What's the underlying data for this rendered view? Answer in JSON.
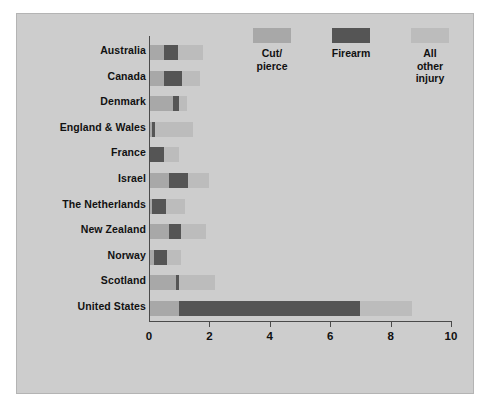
{
  "chart_data": {
    "type": "bar",
    "orientation": "horizontal",
    "stacked": true,
    "title": "",
    "subtitle": "",
    "xlabel": "",
    "ylabel": "",
    "xlim": [
      0,
      10
    ],
    "xticks": [
      0,
      2,
      4,
      6,
      8,
      10
    ],
    "xtick_labels": [
      "0",
      "2",
      "4",
      "6",
      "8",
      "10"
    ],
    "grid": false,
    "legend_position": "top-right",
    "categories": [
      "Australia",
      "Canada",
      "Denmark",
      "England & Wales",
      "France",
      "Israel",
      "The Netherlands",
      "New Zealand",
      "Norway",
      "Scotland",
      "United States"
    ],
    "series": [
      {
        "name": "Cut/pierce",
        "color": "#a8a8a8",
        "values": [
          0.5,
          0.5,
          0.8,
          0.1,
          0.0,
          0.65,
          0.1,
          0.65,
          0.15,
          0.9,
          1.0
        ]
      },
      {
        "name": "Firearm",
        "color": "#555555",
        "values": [
          0.45,
          0.6,
          0.2,
          0.1,
          0.5,
          0.65,
          0.45,
          0.4,
          0.45,
          0.1,
          6.0
        ]
      },
      {
        "name": "All other injury",
        "color": "#bcbcbc",
        "values": [
          0.85,
          0.6,
          0.25,
          1.25,
          0.5,
          0.7,
          0.65,
          0.85,
          0.45,
          1.2,
          1.7
        ]
      }
    ],
    "totals": [
      1.8,
      1.7,
      1.25,
      1.45,
      1.0,
      2.0,
      1.2,
      1.9,
      1.05,
      2.2,
      8.7
    ]
  },
  "legend": {
    "items": [
      {
        "label": "Cut/\npierce",
        "color": "#a8a8a8"
      },
      {
        "label": "Firearm",
        "color": "#555555"
      },
      {
        "label": "All\nother\ninjury",
        "color": "#bcbcbc"
      }
    ]
  },
  "colors": {
    "background": "#cdcdcd",
    "page": "#ffffff",
    "axis": "#4a4a4a",
    "text": "#111111",
    "cut_pierce": "#a8a8a8",
    "firearm": "#555555",
    "all_other_injury": "#bcbcbc"
  }
}
